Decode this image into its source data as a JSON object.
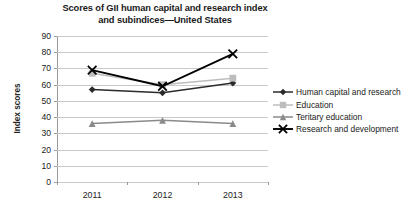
{
  "chart_data": {
    "type": "line",
    "title": "Scores of GII human capital and research index and subindices—United States",
    "title_lines": [
      "Scores of GII human capital and research index",
      "and subindices—United States"
    ],
    "xlabel": "",
    "ylabel": "Index scores",
    "categories": [
      "2011",
      "2012",
      "2013"
    ],
    "x": [
      2011,
      2012,
      2013
    ],
    "ylim": [
      0,
      90
    ],
    "ytick_step": 10,
    "yticks": [
      "90",
      "80",
      "70",
      "60",
      "50",
      "40",
      "30",
      "20",
      "10",
      "0"
    ],
    "grid": true,
    "legend_position": "right",
    "series": [
      {
        "name": "Human capital and research",
        "values": [
          57,
          55,
          61
        ],
        "color": "#2b2b2b",
        "marker": "diamond"
      },
      {
        "name": "Education",
        "values": [
          67,
          60,
          64
        ],
        "color": "#bdbdbd",
        "marker": "square"
      },
      {
        "name": "Teritary education",
        "values": [
          36,
          38,
          36
        ],
        "color": "#8a8a8a",
        "marker": "triangle"
      },
      {
        "name": "Research and development",
        "values": [
          69,
          59,
          79
        ],
        "color": "#000000",
        "marker": "x"
      }
    ]
  },
  "legend": {
    "items": [
      {
        "label": "Human capital and research"
      },
      {
        "label": "Education"
      },
      {
        "label": "Teritary education"
      },
      {
        "label": "Research and development"
      }
    ]
  }
}
